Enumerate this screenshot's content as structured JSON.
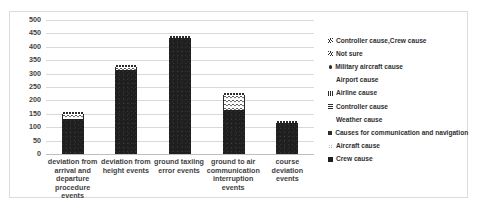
{
  "chart_data": {
    "type": "bar",
    "title": "",
    "xlabel": "",
    "ylabel": "",
    "ylim": [
      0,
      500
    ],
    "ytick_step": 50,
    "grid": true,
    "legend_position": "right",
    "categories": [
      "deviation from arrival and departure procedure events",
      "deviation from height events",
      "ground taxiing error events",
      "ground to air communication interruption events",
      "course deviation events"
    ],
    "ytick_labels": [
      "500",
      "450",
      "400",
      "350",
      "300",
      "250",
      "200",
      "150",
      "100",
      "50",
      "0"
    ],
    "values": [
      152,
      330,
      440,
      228,
      122
    ],
    "bars": [
      {
        "category": "deviation from arrival and departure procedure events",
        "total": 152,
        "dark": 130,
        "light": 18,
        "cap": 4
      },
      {
        "category": "deviation from height events",
        "total": 330,
        "dark": 315,
        "light": 10,
        "cap": 5
      },
      {
        "category": "ground taxiing error events",
        "total": 440,
        "dark": 434,
        "light": 0,
        "cap": 6
      },
      {
        "category": "ground to air communication interruption events",
        "total": 228,
        "dark": 165,
        "light": 55,
        "cap": 8
      },
      {
        "category": "course deviation events",
        "total": 122,
        "dark": 116,
        "light": 0,
        "cap": 6
      }
    ],
    "series": [
      {
        "name": "Controller cause,Crew cause",
        "marker": "hatch-right"
      },
      {
        "name": "Not sure",
        "marker": "hatch-left"
      },
      {
        "name": "Military aircraft cause",
        "marker": "dot"
      },
      {
        "name": "Airport  cause",
        "marker": "sparse-dots"
      },
      {
        "name": "Airline  cause",
        "marker": "vertical-bars"
      },
      {
        "name": "Controller cause",
        "marker": "horizontal-bars"
      },
      {
        "name": "Weather  cause",
        "marker": "star-dots"
      },
      {
        "name": "Causes for communication and navigation",
        "marker": "small-solid-square"
      },
      {
        "name": "Aircraft  cause",
        "marker": "faint-dots"
      },
      {
        "name": "Crew cause",
        "marker": "solid-square"
      }
    ],
    "colors": {
      "bar_dark": "#1f1f1f",
      "bar_light": "#ffffff",
      "gridline": "#d9d9d9",
      "text": "#3f3f3f",
      "border": "#dcdcdc"
    }
  }
}
